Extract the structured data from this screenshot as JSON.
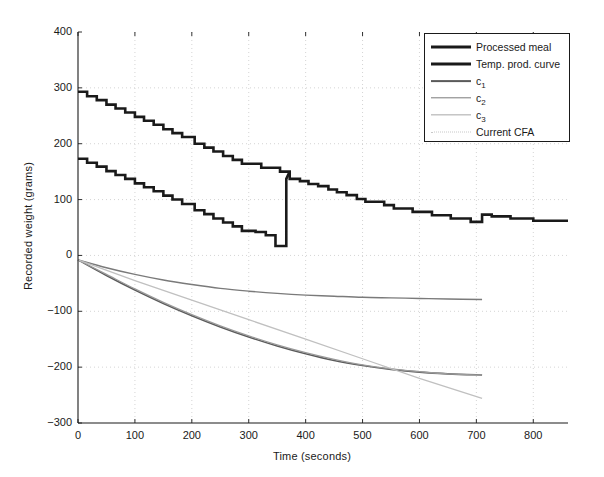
{
  "chart_data": {
    "type": "line",
    "title": "",
    "xlabel": "Time (seconds)",
    "ylabel": "Recorded weight (grams)",
    "xlim": [
      0,
      861
    ],
    "ylim": [
      -300,
      400
    ],
    "xticks": [
      0,
      100,
      200,
      300,
      400,
      500,
      600,
      700,
      800
    ],
    "yticks": [
      -300,
      -200,
      -100,
      0,
      100,
      200,
      300,
      400
    ],
    "grid": "dotted",
    "legend_position": "top-right",
    "series": [
      {
        "name": "Processed meal",
        "style": "step",
        "color": "#1a1a1a",
        "width": 2.6,
        "points": [
          [
            0,
            293
          ],
          [
            16,
            293
          ],
          [
            16,
            285
          ],
          [
            33,
            285
          ],
          [
            33,
            278
          ],
          [
            50,
            278
          ],
          [
            50,
            270
          ],
          [
            66,
            270
          ],
          [
            66,
            263
          ],
          [
            83,
            263
          ],
          [
            83,
            256
          ],
          [
            100,
            256
          ],
          [
            100,
            248
          ],
          [
            116,
            248
          ],
          [
            116,
            241
          ],
          [
            133,
            241
          ],
          [
            133,
            234
          ],
          [
            150,
            234
          ],
          [
            150,
            226
          ],
          [
            166,
            226
          ],
          [
            166,
            219
          ],
          [
            183,
            219
          ],
          [
            183,
            212
          ],
          [
            205,
            212
          ],
          [
            205,
            200
          ],
          [
            222,
            200
          ],
          [
            222,
            193
          ],
          [
            238,
            193
          ],
          [
            238,
            186
          ],
          [
            255,
            186
          ],
          [
            255,
            178
          ],
          [
            272,
            178
          ],
          [
            272,
            171
          ],
          [
            288,
            171
          ],
          [
            288,
            164
          ],
          [
            322,
            164
          ],
          [
            322,
            157
          ],
          [
            355,
            157
          ],
          [
            355,
            150
          ],
          [
            372,
            150
          ],
          [
            372,
            137
          ],
          [
            390,
            137
          ],
          [
            390,
            133
          ],
          [
            405,
            133
          ],
          [
            405,
            128
          ],
          [
            422,
            128
          ],
          [
            422,
            124
          ],
          [
            440,
            124
          ],
          [
            440,
            118
          ],
          [
            455,
            118
          ],
          [
            455,
            113
          ],
          [
            472,
            113
          ],
          [
            472,
            108
          ],
          [
            490,
            108
          ],
          [
            490,
            101
          ],
          [
            505,
            101
          ],
          [
            505,
            96
          ],
          [
            538,
            96
          ],
          [
            538,
            90
          ],
          [
            555,
            90
          ],
          [
            555,
            84
          ],
          [
            588,
            84
          ],
          [
            588,
            78
          ],
          [
            622,
            78
          ],
          [
            622,
            72
          ],
          [
            655,
            72
          ],
          [
            655,
            66
          ],
          [
            690,
            66
          ],
          [
            690,
            60
          ],
          [
            710,
            60
          ],
          [
            710,
            73
          ],
          [
            727,
            73
          ],
          [
            727,
            70
          ],
          [
            760,
            70
          ],
          [
            760,
            66
          ],
          [
            800,
            66
          ],
          [
            800,
            62
          ],
          [
            861,
            62
          ]
        ]
      },
      {
        "name": "Temp. prod. curve",
        "style": "step",
        "color": "#1a1a1a",
        "width": 2.6,
        "points": [
          [
            0,
            173
          ],
          [
            16,
            173
          ],
          [
            16,
            166
          ],
          [
            33,
            166
          ],
          [
            33,
            159
          ],
          [
            50,
            159
          ],
          [
            50,
            151
          ],
          [
            66,
            151
          ],
          [
            66,
            144
          ],
          [
            83,
            144
          ],
          [
            83,
            137
          ],
          [
            100,
            137
          ],
          [
            100,
            129
          ],
          [
            116,
            129
          ],
          [
            116,
            122
          ],
          [
            133,
            122
          ],
          [
            133,
            115
          ],
          [
            150,
            115
          ],
          [
            150,
            107
          ],
          [
            166,
            107
          ],
          [
            166,
            100
          ],
          [
            183,
            100
          ],
          [
            183,
            92
          ],
          [
            205,
            92
          ],
          [
            205,
            81
          ],
          [
            222,
            81
          ],
          [
            222,
            74
          ],
          [
            238,
            74
          ],
          [
            238,
            66
          ],
          [
            255,
            66
          ],
          [
            255,
            59
          ],
          [
            272,
            59
          ],
          [
            272,
            52
          ],
          [
            288,
            52
          ],
          [
            288,
            44
          ],
          [
            312,
            44
          ],
          [
            312,
            42
          ],
          [
            330,
            42
          ],
          [
            330,
            36
          ],
          [
            347,
            36
          ],
          [
            347,
            17
          ],
          [
            366,
            17
          ],
          [
            366,
            137
          ],
          [
            372,
            150
          ]
        ]
      },
      {
        "name": "c1",
        "display_name": "c₁",
        "style": "smooth",
        "color": "#5a5a5a",
        "width": 1.6,
        "points": [
          [
            0,
            -8
          ],
          [
            50,
            -36
          ],
          [
            100,
            -62
          ],
          [
            150,
            -86
          ],
          [
            200,
            -108
          ],
          [
            250,
            -128
          ],
          [
            300,
            -146
          ],
          [
            350,
            -162
          ],
          [
            400,
            -176
          ],
          [
            450,
            -188
          ],
          [
            500,
            -197
          ],
          [
            550,
            -204
          ],
          [
            600,
            -209
          ],
          [
            650,
            -212
          ],
          [
            710,
            -214
          ]
        ]
      },
      {
        "name": "c2",
        "display_name": "c₂",
        "style": "smooth",
        "color": "#7a7a7a",
        "width": 1.4,
        "points": [
          [
            0,
            -8
          ],
          [
            50,
            -22
          ],
          [
            100,
            -34
          ],
          [
            150,
            -44
          ],
          [
            200,
            -52
          ],
          [
            250,
            -59
          ],
          [
            300,
            -64
          ],
          [
            350,
            -68
          ],
          [
            400,
            -71
          ],
          [
            450,
            -73
          ],
          [
            500,
            -75
          ],
          [
            550,
            -76
          ],
          [
            600,
            -77
          ],
          [
            650,
            -78
          ],
          [
            710,
            -79
          ]
        ]
      },
      {
        "name": "c3",
        "display_name": "c₃",
        "style": "smooth",
        "color": "#9a9a9a",
        "width": 1.3,
        "points": [
          [
            0,
            -8
          ],
          [
            50,
            -34
          ],
          [
            100,
            -60
          ],
          [
            150,
            -84
          ],
          [
            200,
            -106
          ],
          [
            250,
            -126
          ],
          [
            300,
            -144
          ],
          [
            350,
            -160
          ],
          [
            400,
            -174
          ],
          [
            450,
            -186
          ],
          [
            500,
            -196
          ],
          [
            550,
            -203
          ],
          [
            600,
            -208
          ],
          [
            650,
            -212
          ],
          [
            710,
            -214
          ]
        ]
      },
      {
        "name": "Current CFA",
        "style": "line",
        "color": "#c0c0c0",
        "width": 1.3,
        "points": [
          [
            0,
            -8
          ],
          [
            100,
            -45
          ],
          [
            200,
            -80
          ],
          [
            300,
            -115
          ],
          [
            400,
            -150
          ],
          [
            500,
            -185
          ],
          [
            600,
            -220
          ],
          [
            710,
            -256
          ]
        ]
      }
    ]
  },
  "legend": {
    "entries": [
      {
        "label": "Processed meal",
        "sub": "",
        "color": "#1a1a1a",
        "width": 3.0,
        "dash": "none"
      },
      {
        "label": "Temp. prod. curve",
        "sub": "",
        "color": "#1a1a1a",
        "width": 3.0,
        "dash": "none"
      },
      {
        "label": "c",
        "sub": "1",
        "color": "#5a5a5a",
        "width": 1.8,
        "dash": "none"
      },
      {
        "label": "c",
        "sub": "2",
        "color": "#7a7a7a",
        "width": 1.4,
        "dash": "none"
      },
      {
        "label": "c",
        "sub": "3",
        "color": "#a8a8a8",
        "width": 1.3,
        "dash": "none"
      },
      {
        "label": "Current CFA",
        "sub": "",
        "color": "#c8c8c8",
        "width": 1.3,
        "dash": "2 2"
      }
    ]
  }
}
